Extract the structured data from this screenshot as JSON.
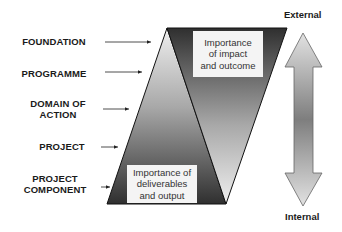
{
  "levels": [
    {
      "label": "FOUNDATION"
    },
    {
      "label": "PROGRAMME"
    },
    {
      "label": "DOMAIN OF ACTION",
      "line1": "DOMAIN OF",
      "line2": "ACTION"
    },
    {
      "label": "PROJECT"
    },
    {
      "label": "PROJECT COMPONENT",
      "line1": "PROJECT",
      "line2": "COMPONENT"
    }
  ],
  "boxes": {
    "top": {
      "line1": "Importance",
      "line2": "of impact",
      "line3": "and outcome"
    },
    "bottom": {
      "line1": "Importance of",
      "line2": "deliverables",
      "line3": "and output"
    }
  },
  "scale": {
    "top_label": "External",
    "bottom_label": "Internal"
  },
  "colors": {
    "dark": "#2e2e2e",
    "light": "#e6e6e6",
    "mid": "#8c8c8c"
  }
}
